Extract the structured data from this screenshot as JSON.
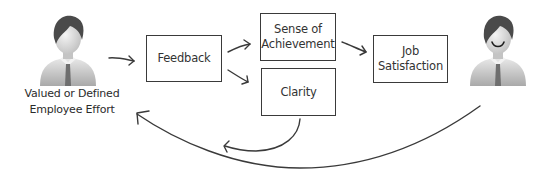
{
  "diagram": {
    "nodes": {
      "employee": {
        "label": "Valued or Defined\nEmployee Effort",
        "icon": "employee-person-icon"
      },
      "feedback": {
        "label": "Feedback"
      },
      "achievement": {
        "label": "Sense of\nAchievement"
      },
      "clarity": {
        "label": "Clarity"
      },
      "satisfaction": {
        "label": "Job\nSatisfaction"
      },
      "satisfied_employee": {
        "icon": "smiling-person-icon"
      }
    },
    "edges": [
      {
        "from": "employee",
        "to": "feedback"
      },
      {
        "from": "feedback",
        "to": "achievement"
      },
      {
        "from": "feedback",
        "to": "clarity"
      },
      {
        "from": "achievement",
        "to": "satisfaction"
      },
      {
        "from": "clarity",
        "to": "employee",
        "style": "curved"
      },
      {
        "from": "satisfied_employee",
        "to": "employee",
        "style": "curved"
      }
    ],
    "colors": {
      "stroke": "#3a3a3a",
      "text": "#333333",
      "hair": "#4a4a4a",
      "shirt": "#c9c9c9",
      "tie": "#6e6e6e"
    }
  }
}
